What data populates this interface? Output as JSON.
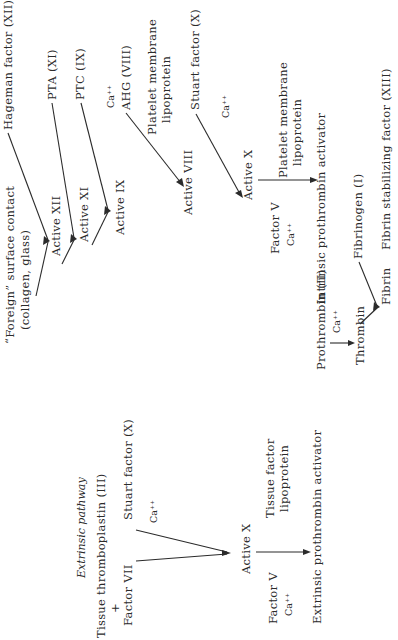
{
  "diagram": {
    "extrinsic": {
      "heading": "Extrinsic pathway",
      "tissue_thromboplastin": "Tissue thromboplastin (III)",
      "plus": "+",
      "factor_vii": "Factor VII",
      "stuart_factor": "Stuart factor (X)",
      "calcium": "Ca⁺⁺",
      "active_x": "Active X",
      "tissue_factor_line1": "Tissue factor",
      "tissue_factor_line2": "lipoprotein",
      "factor_v": "Factor V",
      "factor_v_calcium": "Ca⁺⁺",
      "activator": "Extrinsic prothrombin activator"
    },
    "intrinsic": {
      "foreign_line1": "“Foreign” surface contact",
      "foreign_line2": "(collagen, glass)",
      "hageman": "Hageman factor (XII)",
      "active_xii": "Active XII",
      "pta": "PTA (XI)",
      "active_xi": "Active XI",
      "ptc": "PTC (IX)",
      "active_ix": "Active IX",
      "calcium_1": "Ca⁺⁺",
      "ahg": "AHG (VIII)",
      "platelet1_line1": "Platelet membrane",
      "platelet1_line2": "lipoprotein",
      "active_viii": "Active VIII",
      "stuart_factor": "Stuart factor (X)",
      "calcium_2": "Ca⁺⁺",
      "active_x": "Active X",
      "platelet2_line1": "Platelet membrane",
      "platelet2_line2": "lipoprotein",
      "factor_v": "Factor V",
      "factor_v_calcium": "Ca⁺⁺",
      "activator": "Intrinsic prothrombin activator"
    },
    "common": {
      "prothrombin": "Prothrombin (II)",
      "calcium": "Ca⁺⁺",
      "thrombin": "Thrombin",
      "fibrinogen": "Fibrinogen (I)",
      "fibrin": "Fibrin",
      "fibrin_stabilizing": "Fibrin stabilizing factor (XIII)"
    }
  }
}
